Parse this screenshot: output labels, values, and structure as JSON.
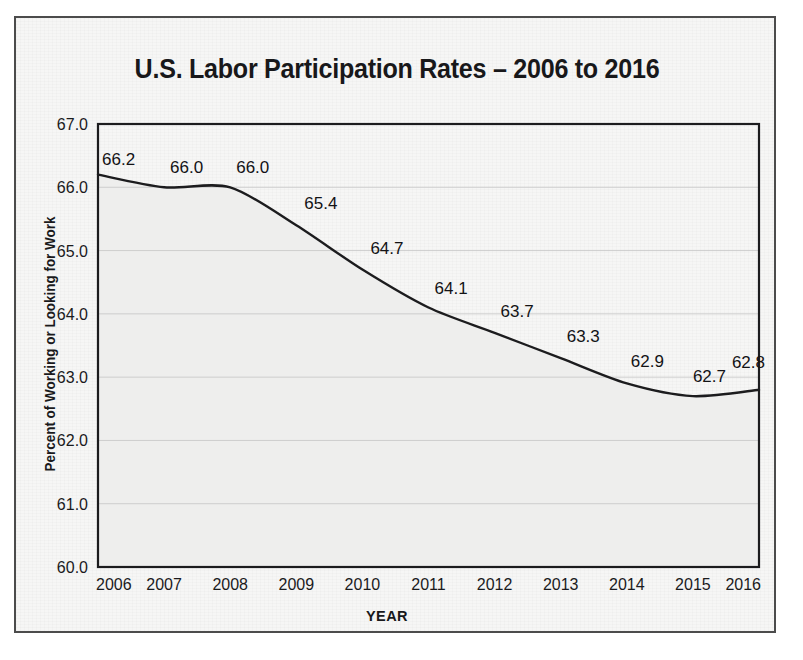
{
  "chart_data": {
    "type": "line",
    "title": "U.S. Labor Participation Rates – 2006 to 2016",
    "xlabel": "YEAR",
    "ylabel": "Percent of Working or Looking for Work",
    "categories": [
      "2006",
      "2007",
      "2008",
      "2009",
      "2010",
      "2011",
      "2012",
      "2013",
      "2014",
      "2015",
      "2016"
    ],
    "values": [
      66.2,
      66.0,
      66.0,
      65.4,
      64.7,
      64.1,
      63.7,
      63.3,
      62.9,
      62.7,
      62.8
    ],
    "value_labels": [
      "66.2",
      "66.0",
      "66.0",
      "65.4",
      "64.7",
      "64.1",
      "63.7",
      "63.3",
      "62.9",
      "62.7",
      "62.8"
    ],
    "ylim": [
      60.0,
      67.0
    ],
    "ytick_labels": [
      "67.0",
      "66.0",
      "65.0",
      "64.0",
      "63.0",
      "62.0",
      "61.0",
      "60.0"
    ],
    "ytick_values": [
      67.0,
      66.0,
      65.0,
      64.0,
      63.0,
      62.0,
      61.0,
      60.0
    ],
    "grid": true,
    "legend": "none",
    "area_fill": true,
    "colors": {
      "line": "#1c1c1e",
      "area_fill": "#eeeeed",
      "gridline": "#c9c9c9",
      "axis": "#1c1c1e",
      "text": "#18181a",
      "paper": "#f6f6f5",
      "frame": "#4c4c4c"
    }
  }
}
